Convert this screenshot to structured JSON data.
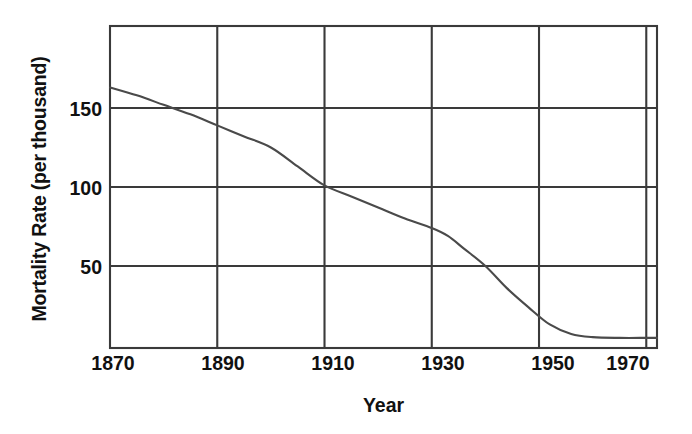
{
  "chart_data": {
    "type": "line",
    "title": "",
    "xlabel": "Year",
    "ylabel": "Mortality Rate (per thousand)",
    "xlim": [
      1870,
      1972
    ],
    "ylim": [
      0,
      190
    ],
    "xticks": [
      1870,
      1890,
      1910,
      1930,
      1950,
      1970
    ],
    "xtick_labels": [
      "1870",
      "1890",
      "1910",
      "1930",
      "1950",
      "1970"
    ],
    "yticks": [
      50,
      100,
      150
    ],
    "ytick_labels": [
      "50",
      "100",
      "150"
    ],
    "grid": true,
    "grid_color": "#3a3a3a",
    "axis_color": "#3a3a3a",
    "line_color": "#4a4a4a",
    "background": "#ffffff",
    "legend": null,
    "series": [
      {
        "name": "Mortality Rate",
        "x": [
          1870,
          1875,
          1880,
          1885,
          1890,
          1895,
          1900,
          1905,
          1910,
          1915,
          1920,
          1925,
          1930,
          1933,
          1936,
          1940,
          1944,
          1948,
          1952,
          1956,
          1960,
          1965,
          1970,
          1972
        ],
        "values": [
          163,
          158,
          152,
          146,
          139,
          132,
          125,
          113,
          101,
          94,
          87,
          80,
          74,
          69,
          61,
          50,
          36,
          24,
          13,
          7,
          5,
          4.5,
          4.5,
          4.5
        ]
      }
    ]
  }
}
